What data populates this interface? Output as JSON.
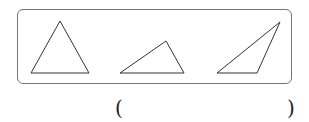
{
  "figure": {
    "shapes": [
      {
        "name": "triangle-1",
        "kind": "acute triangle"
      },
      {
        "name": "triangle-2",
        "kind": "obtuse triangle"
      },
      {
        "name": "triangle-3",
        "kind": "obtuse triangle"
      }
    ]
  },
  "answer": {
    "open": "(",
    "close": ")",
    "value": ""
  }
}
